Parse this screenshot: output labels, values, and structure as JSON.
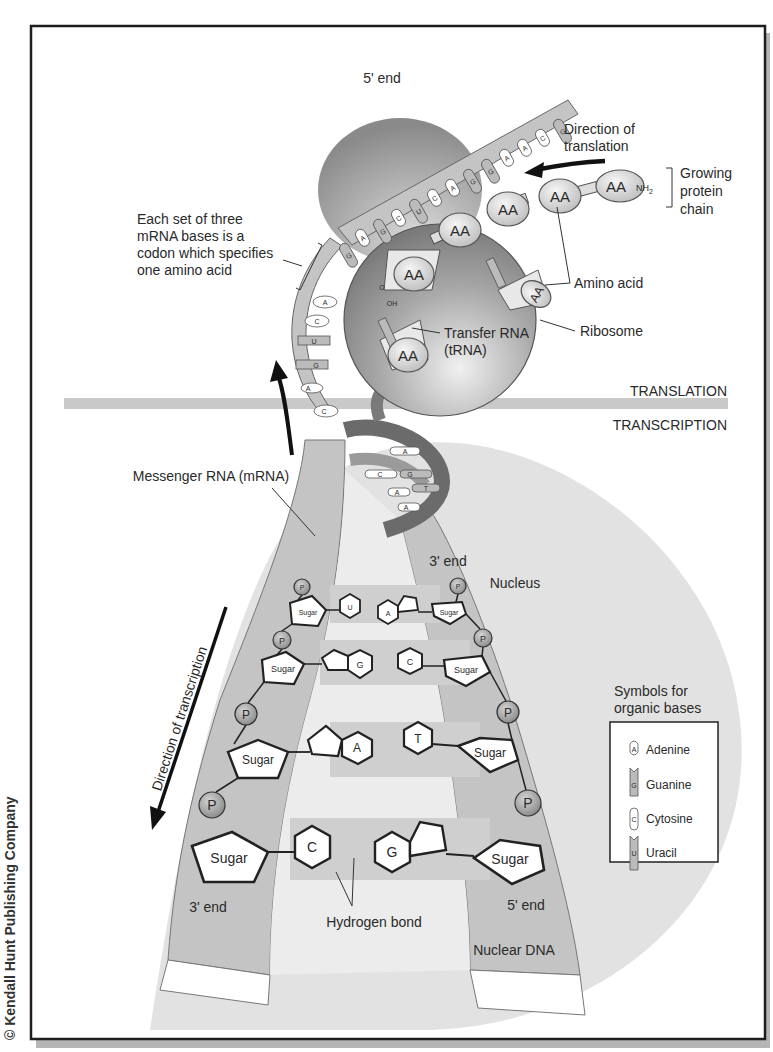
{
  "figure": {
    "copyright": "© Kendall Hunt Publishing Company",
    "colors": {
      "frame": "#1e1e1e",
      "shadow": "#b5b5b5",
      "ribosome": "#8f8f8f",
      "strand": "#c4c4c4",
      "nucleus": "#dcdcdc",
      "band": "#c9c9c9",
      "helix": "#6b6b6b",
      "phosphate": "#9a9a9a"
    }
  },
  "translation_section": {
    "section_label": "TRANSLATION",
    "mrna_5_end": "5' end",
    "direction_of_translation": [
      "Direction of",
      "translation"
    ],
    "growing_protein_chain": [
      "Growing",
      "protein",
      "chain"
    ],
    "nh2": "NH",
    "nh2_sub": "2",
    "codon_note": [
      "Each set of three",
      "mRNA bases is a",
      "codon which specifies",
      "one amino acid"
    ],
    "amino_acid": "Amino acid",
    "transfer_rna": [
      "Transfer RNA",
      "(tRNA)"
    ],
    "ribosome": "Ribosome",
    "aa": "AA",
    "carboxyl_o": "O",
    "carboxyl_oh": "OH",
    "mrna_bases_top": [
      "G",
      "C",
      "A",
      "A",
      "G",
      "G",
      "A",
      "C",
      "U",
      "C",
      "G",
      "A",
      "G"
    ],
    "mrna_bases_left": [
      "A",
      "C",
      "U",
      "G",
      "A",
      "C"
    ]
  },
  "transcription_section": {
    "section_label": "TRANSCRIPTION",
    "messenger_rna": "Messenger RNA (mRNA)",
    "direction_of_transcription": "Direction of transcription",
    "nucleus": "Nucleus",
    "nuclear_dna": "Nuclear DNA",
    "hydrogen_bond": "Hydrogen bond",
    "end_3_top": "3' end",
    "end_3_bottom": "3' end",
    "end_5_bottom": "5' end",
    "sugar": "Sugar",
    "phosphate": "P",
    "helix_bases": [
      "A",
      "C",
      "G",
      "A",
      "T",
      "A"
    ],
    "base_pairs": [
      {
        "left": "U",
        "right": "A"
      },
      {
        "left": "G",
        "right": "C"
      },
      {
        "left": "A",
        "right": "T"
      },
      {
        "left": "C",
        "right": "G"
      }
    ]
  },
  "legend": {
    "title": [
      "Symbols for",
      "organic bases"
    ],
    "items": [
      {
        "symbol": "A",
        "label": "Adenine"
      },
      {
        "symbol": "G",
        "label": "Guanine"
      },
      {
        "symbol": "C",
        "label": "Cytosine"
      },
      {
        "symbol": "U",
        "label": "Uracil"
      }
    ]
  }
}
